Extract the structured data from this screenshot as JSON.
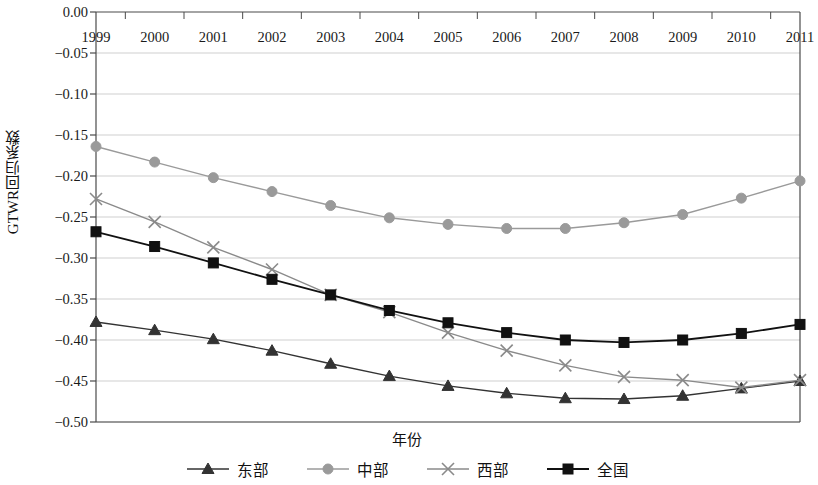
{
  "chart_data": {
    "type": "line",
    "title": "",
    "xlabel": "年份",
    "ylabel": "GTWR回归系数",
    "categories": [
      "1999",
      "2000",
      "2001",
      "2002",
      "2003",
      "2004",
      "2005",
      "2006",
      "2007",
      "2008",
      "2009",
      "2010",
      "2011"
    ],
    "xlim": [
      1999,
      2011
    ],
    "ylim": [
      -0.5,
      0.0
    ],
    "yticks": [
      0.0,
      -0.05,
      -0.1,
      -0.15,
      -0.2,
      -0.25,
      -0.3,
      -0.35,
      -0.4,
      -0.45,
      -0.5
    ],
    "ytick_labels": [
      "0.00",
      "−0.05",
      "−0.10",
      "−0.15",
      "−0.20",
      "−0.25",
      "−0.30",
      "−0.35",
      "−0.40",
      "−0.45",
      "−0.50"
    ],
    "grid": true,
    "grid_axis": "y",
    "legend_position": "bottom",
    "xaxis_position": "top",
    "series": [
      {
        "name": "东部",
        "marker": "triangle",
        "color": "#333333",
        "values": [
          -0.378,
          -0.388,
          -0.399,
          -0.413,
          -0.429,
          -0.444,
          -0.456,
          -0.465,
          -0.471,
          -0.472,
          -0.468,
          -0.459,
          -0.45
        ]
      },
      {
        "name": "中部",
        "marker": "circle",
        "color": "#9a9a9a",
        "values": [
          -0.164,
          -0.183,
          -0.202,
          -0.219,
          -0.236,
          -0.251,
          -0.259,
          -0.264,
          -0.264,
          -0.257,
          -0.247,
          -0.227,
          -0.206
        ]
      },
      {
        "name": "西部",
        "marker": "x",
        "color": "#8a8a8a",
        "values": [
          -0.228,
          -0.256,
          -0.287,
          -0.314,
          -0.345,
          -0.366,
          -0.391,
          -0.413,
          -0.431,
          -0.445,
          -0.449,
          -0.458,
          -0.449
        ]
      },
      {
        "name": "全国",
        "marker": "square",
        "color": "#111111",
        "values": [
          -0.268,
          -0.286,
          -0.306,
          -0.326,
          -0.345,
          -0.364,
          -0.379,
          -0.391,
          -0.4,
          -0.403,
          -0.4,
          -0.392,
          -0.381
        ]
      }
    ]
  },
  "legend": {
    "items": [
      {
        "label": "东部",
        "marker": "triangle",
        "color": "#333333"
      },
      {
        "label": "中部",
        "marker": "circle",
        "color": "#9a9a9a"
      },
      {
        "label": "西部",
        "marker": "x",
        "color": "#8a8a8a"
      },
      {
        "label": "全国",
        "marker": "square",
        "color": "#111111"
      }
    ]
  },
  "axes": {
    "y_title": "GTWR回归系数",
    "x_title": "年份"
  }
}
